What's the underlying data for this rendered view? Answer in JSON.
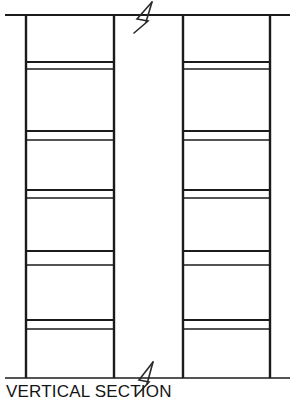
{
  "drawing": {
    "title": "VERTICAL SECTION",
    "view_type": "vertical-section",
    "caption_label": "VERTICAL SECTION",
    "canvas": {
      "width": 294,
      "height": 409,
      "background": "#ffffff"
    },
    "colors": {
      "line": "#1b1b1b",
      "break_symbol": "#2a2a2a",
      "text": "#141414",
      "background": "#ffffff"
    },
    "horizontal_rails": [
      {
        "name": "top-rail",
        "y": 15,
        "x1": 5,
        "x2": 290
      },
      {
        "name": "bottom-rail",
        "y": 378,
        "x1": 5,
        "x2": 290
      }
    ],
    "vertical_posts": [
      {
        "name": "post-left-outer",
        "x": 26,
        "y1": 15,
        "y2": 378
      },
      {
        "name": "post-left-inner",
        "x": 114,
        "y1": 15,
        "y2": 378
      },
      {
        "name": "post-right-inner",
        "x": 183,
        "y1": 15,
        "y2": 378
      },
      {
        "name": "post-right-outer",
        "x": 270,
        "y1": 15,
        "y2": 378
      }
    ],
    "bays": [
      {
        "name": "left-bay",
        "x1": 26,
        "x2": 114
      },
      {
        "name": "right-bay",
        "x1": 183,
        "x2": 270
      }
    ],
    "shelves": [
      {
        "index": 1,
        "top_y": 62,
        "bottom_y": 69
      },
      {
        "index": 2,
        "top_y": 131,
        "bottom_y": 140
      },
      {
        "index": 3,
        "top_y": 190,
        "bottom_y": 198
      },
      {
        "index": 4,
        "top_y": 251,
        "bottom_y": 265
      },
      {
        "index": 5,
        "top_y": 320,
        "bottom_y": 329
      }
    ],
    "break_symbols": [
      {
        "name": "break-symbol-top",
        "cx": 142,
        "cy": 15
      },
      {
        "name": "break-symbol-bottom",
        "cx": 142,
        "cy": 378
      }
    ]
  }
}
